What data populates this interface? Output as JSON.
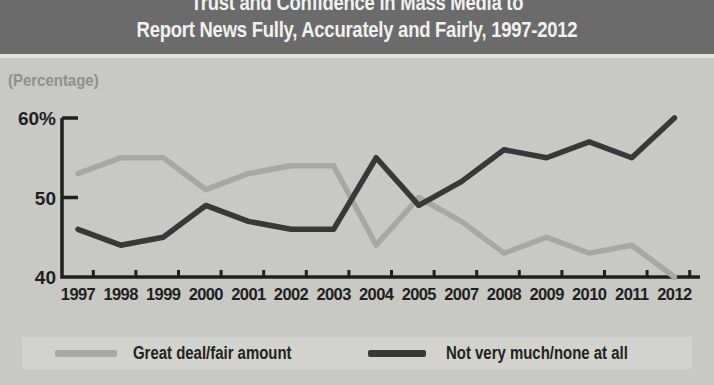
{
  "header": {
    "line1": "Trust and Confidence in Mass Media to",
    "line2": "Report News Fully, Accurately and Fairly, 1997-2012"
  },
  "chart_data": {
    "type": "line",
    "title": "Trust and Confidence in Mass Media to Report News Fully, Accurately and Fairly, 1997-2012",
    "ylabel": "(Percentage)",
    "xlabel": "",
    "categories": [
      "1997",
      "1998",
      "1999",
      "2000",
      "2001",
      "2002",
      "2003",
      "2004",
      "2005",
      "2007",
      "2008",
      "2009",
      "2010",
      "2011",
      "2012"
    ],
    "series": [
      {
        "name": "Great deal/fair amount",
        "color": "#a7a7a4",
        "values": [
          53,
          55,
          55,
          51,
          53,
          54,
          54,
          44,
          50,
          47,
          43,
          45,
          43,
          44,
          40
        ]
      },
      {
        "name": "Not very much/none at all",
        "color": "#383838",
        "values": [
          46,
          44,
          45,
          49,
          47,
          46,
          46,
          55,
          49,
          52,
          56,
          55,
          57,
          55,
          60
        ]
      }
    ],
    "ylim": [
      40,
      60
    ],
    "yticks": [
      {
        "value": 40,
        "label": "40"
      },
      {
        "value": 50,
        "label": "50"
      },
      {
        "value": 60,
        "label": "60%"
      }
    ],
    "grid": false,
    "legend_position": "bottom"
  },
  "colors": {
    "title_bar": "#6b6b6b",
    "title_text": "#f1f1ef",
    "page_bg": "#c8c8c5",
    "legend_band_bg": "#d2d2cf",
    "axis": "#1f1f1f",
    "muted_label": "#8f8f8d"
  }
}
